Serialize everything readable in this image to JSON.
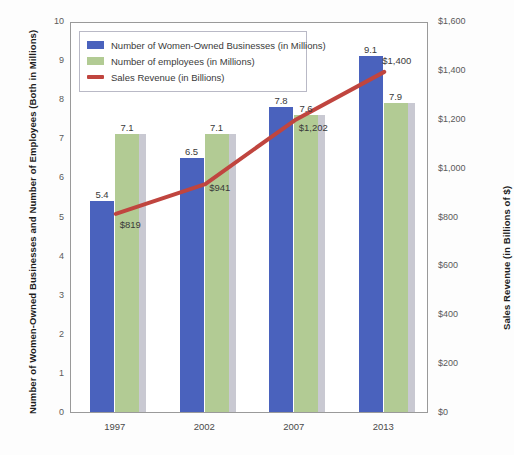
{
  "chart_data": {
    "type": "bar",
    "title": "",
    "subtitle": "",
    "categories": [
      "1997",
      "2002",
      "2007",
      "2013"
    ],
    "xlabel": "",
    "ylabel": "Number of Women-Owned Businesses and Number of Employees (Both in Millions)",
    "ylabel_right": "Sales Revenue (in Billions of $)",
    "ylim": [
      0,
      10
    ],
    "ylim_right": [
      0,
      1600
    ],
    "yticks": [
      "0",
      "1",
      "2",
      "3",
      "4",
      "5",
      "6",
      "7",
      "8",
      "9",
      "10"
    ],
    "yticks_right": [
      "$0",
      "$200",
      "$400",
      "$600",
      "$800",
      "$1,000",
      "$1,200",
      "$1,400",
      "$1,600"
    ],
    "grid": false,
    "legend_position": "top-left",
    "series": [
      {
        "name": "Number of Women-Owned Businesses (in Millions)",
        "type": "bar",
        "axis": "left",
        "color": "#4a62bd",
        "values": [
          5.4,
          6.5,
          7.8,
          9.1
        ],
        "labels": [
          "5.4",
          "6.5",
          "7.8",
          "9.1"
        ]
      },
      {
        "name": "Number of employees (in Millions)",
        "type": "bar",
        "axis": "left",
        "color": "#b2cb94",
        "values": [
          7.1,
          7.1,
          7.6,
          7.9
        ],
        "labels": [
          "7.1",
          "7.1",
          "7.6",
          "7.9"
        ]
      },
      {
        "name": "Sales Revenue (in Billions)",
        "type": "line",
        "axis": "right",
        "color": "#c0453f",
        "values": [
          819,
          941,
          1202,
          1400
        ],
        "labels": [
          "$819",
          "$941",
          "$1,202",
          "$1,400"
        ]
      }
    ]
  },
  "legend": {
    "items": [
      {
        "label": "Number of Women-Owned Businesses (in Millions)",
        "swatch": "blue"
      },
      {
        "label": "Number of employees (in Millions)",
        "swatch": "green"
      },
      {
        "label": "Sales Revenue (in Billions)",
        "swatch": "line"
      }
    ]
  },
  "colors": {
    "bar_blue": "#4a62bd",
    "bar_green": "#b2cb94",
    "line_red": "#c0453f",
    "bar_shadow": "#c9c9d2",
    "frame": "#9a9a9a",
    "background": "#fdfdfd"
  }
}
